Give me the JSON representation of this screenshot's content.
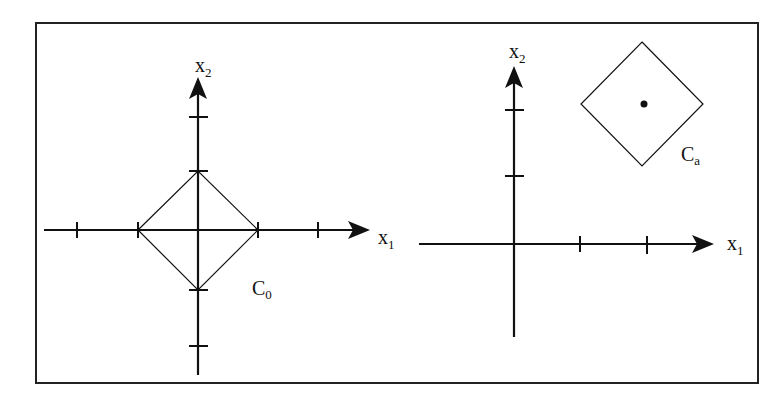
{
  "figure": {
    "frame_color": "#222222",
    "ink_color": "#111111",
    "left_panel": {
      "x_axis_label": "x",
      "x_axis_subscript": "1",
      "y_axis_label": "x",
      "y_axis_subscript": "2",
      "shape_label": "C",
      "shape_subscript": "0",
      "description": "Diamond (L1 unit ball) centered at origin with vertices on axes at ±1; axes have ticks at ±1, ±2"
    },
    "right_panel": {
      "x_axis_label": "x",
      "x_axis_subscript": "1",
      "y_axis_label": "x",
      "y_axis_subscript": "2",
      "shape_label": "C",
      "shape_subscript": "a",
      "description": "Translated diamond centered at point a (marked with a dot) in the first quadrant; axes have ticks at 1, 2"
    }
  }
}
